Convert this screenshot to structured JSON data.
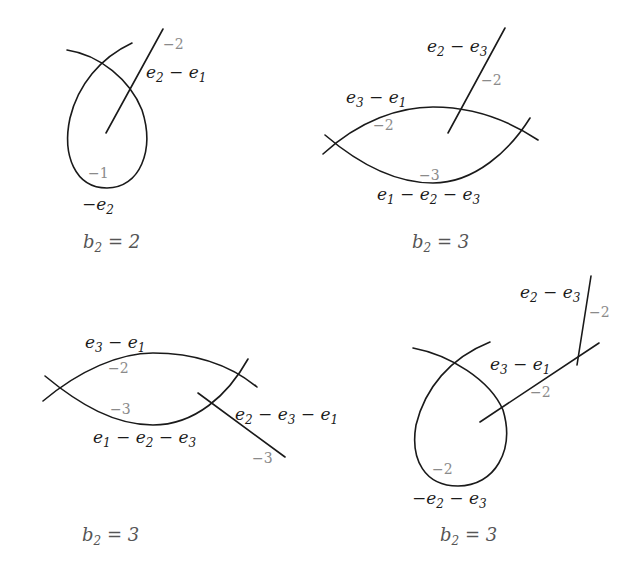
{
  "diagrams": [
    {
      "id": "top-left",
      "caption": "b2 = 2",
      "caption_parts": {
        "var": "b",
        "sub": "2",
        "rest": " = 2"
      },
      "curves": [
        {
          "label": "−e",
          "label_sub": "2",
          "label_rest": "",
          "weight": "−1",
          "shape": "loop"
        },
        {
          "label": "e",
          "label_sub": "2",
          "label_rest": " − e",
          "label_sub2": "1",
          "weight": "−2",
          "shape": "line"
        }
      ]
    },
    {
      "id": "top-right",
      "caption": "b2 = 3",
      "caption_parts": {
        "var": "b",
        "sub": "2",
        "rest": " = 3"
      },
      "curves": [
        {
          "label": "e3 − e1",
          "weight": "−2",
          "shape": "upper-arc"
        },
        {
          "label": "e1 − e2 − e3",
          "weight": "−3",
          "shape": "lower-arc"
        },
        {
          "label": "e2 − e3",
          "weight": "−2",
          "shape": "line"
        }
      ]
    },
    {
      "id": "bottom-left",
      "caption": "b2 = 3",
      "caption_parts": {
        "var": "b",
        "sub": "2",
        "rest": " = 3"
      },
      "curves": [
        {
          "label": "e3 − e1",
          "weight": "−2",
          "shape": "upper-arc"
        },
        {
          "label": "e1 − e2 − e3",
          "weight": "−3",
          "shape": "lower-arc"
        },
        {
          "label": "e2 − e3 − e1",
          "weight": "−3",
          "shape": "line"
        }
      ]
    },
    {
      "id": "bottom-right",
      "caption": "b2 = 3",
      "caption_parts": {
        "var": "b",
        "sub": "2",
        "rest": " = 3"
      },
      "curves": [
        {
          "label": "−e2 − e3",
          "weight": "−2",
          "shape": "loop"
        },
        {
          "label": "e3 − e1",
          "weight": "−2",
          "shape": "line"
        },
        {
          "label": "e2 − e3",
          "weight": "−2",
          "shape": "line"
        }
      ]
    }
  ],
  "text": {
    "d1": {
      "loop_w": "−1",
      "line_w": "−2",
      "minus": "−",
      "e": "e",
      "s1": "1",
      "s2": "2",
      "s3": "3",
      "minus_sp": " − ",
      "b": "b",
      "eq2": " = 2",
      "eq3": " = 3"
    }
  }
}
